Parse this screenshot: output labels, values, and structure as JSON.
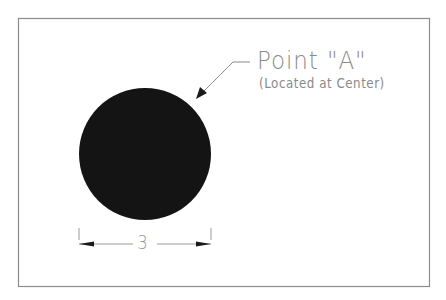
{
  "diagram": {
    "type": "technical-drawing",
    "frame": {
      "x": 18,
      "y": 18,
      "width": 411,
      "height": 268,
      "stroke": "#8c8c8c"
    },
    "circle": {
      "cx": 145,
      "cy": 154,
      "r": 66,
      "fill": "#141414"
    },
    "callout": {
      "title": "Point \"A\"",
      "subtitle": "(Located at Center)",
      "text_color": "#8a8a8a",
      "leader": {
        "tip": [
          197,
          98
        ],
        "elbow": [
          233,
          62
        ],
        "end": [
          250,
          62
        ]
      }
    },
    "dimension": {
      "value": "3",
      "line_y": 244,
      "from_x": 79,
      "to_x": 211,
      "text_color": "#9a9a9a"
    }
  }
}
